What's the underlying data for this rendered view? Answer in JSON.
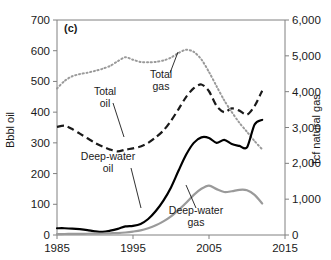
{
  "panel": {
    "label": "(c)"
  },
  "axes": {
    "left": {
      "title": "Bbbl oil",
      "ticks": [
        "0",
        "100",
        "200",
        "300",
        "400",
        "500",
        "600",
        "700"
      ],
      "min": 0,
      "max": 700,
      "step": 100
    },
    "right": {
      "title": "Tcf natural gas",
      "ticks": [
        "0",
        "1,000",
        "2,000",
        "3,000",
        "4,000",
        "5,000",
        "6,000"
      ],
      "min": 0,
      "max": 6000,
      "step": 1000
    },
    "bottom": {
      "title": "",
      "ticks": [
        "1985",
        "1995",
        "2005",
        "2015"
      ],
      "min": 1985,
      "max": 2015,
      "step": 10
    }
  },
  "annotations": [
    {
      "name": "total-gas",
      "lines": [
        "Total",
        "gas"
      ],
      "x": 161,
      "y": 78
    },
    {
      "name": "total-oil",
      "lines": [
        "Total",
        "oil"
      ],
      "x": 105,
      "y": 95
    },
    {
      "name": "deep-water-oil",
      "lines": [
        "Deep-water",
        "oil"
      ],
      "x": 108,
      "y": 160
    },
    {
      "name": "deep-water-gas",
      "lines": [
        "Deep-water",
        "gas"
      ],
      "x": 196,
      "y": 214
    }
  ],
  "colors": {
    "total_oil": "#1a1a1a",
    "total_gas": "#9a9a9a",
    "deep_water_oil": "#000000",
    "deep_water_gas": "#9a9a9a",
    "axis": "#808080",
    "text": "#1a1a1a"
  },
  "chart_data": {
    "type": "line",
    "title": "(c)",
    "xlabel": "",
    "ylabel": "Bbbl oil",
    "y2label": "Tcf natural gas",
    "xlim": [
      1985,
      2015
    ],
    "ylim": [
      0,
      700
    ],
    "y2lim": [
      0,
      6000
    ],
    "grid": false,
    "legend": "annotations-inline",
    "x": [
      1985,
      1986,
      1987,
      1988,
      1989,
      1990,
      1991,
      1992,
      1993,
      1994,
      1995,
      1996,
      1997,
      1998,
      1999,
      2000,
      2001,
      2002,
      2003,
      2004,
      2005,
      2006,
      2007,
      2008,
      2009,
      2010,
      2011,
      2012
    ],
    "series": [
      {
        "name": "Total oil",
        "axis": "left",
        "units": "Bbbl",
        "style": "dashed",
        "color": "#1a1a1a",
        "values": [
          352,
          356,
          345,
          330,
          315,
          300,
          288,
          278,
          272,
          278,
          282,
          288,
          300,
          318,
          340,
          372,
          410,
          450,
          478,
          490,
          468,
          420,
          400,
          412,
          405,
          392,
          420,
          470
        ]
      },
      {
        "name": "Total gas",
        "axis": "right",
        "units": "Tcf",
        "style": "dotted",
        "color": "#9a9a9a",
        "values": [
          4090,
          4300,
          4430,
          4490,
          4530,
          4580,
          4640,
          4720,
          4850,
          4960,
          4890,
          4830,
          4820,
          4830,
          4870,
          4950,
          5080,
          5170,
          5110,
          4900,
          4550,
          4150,
          3760,
          3430,
          3130,
          2880,
          2620,
          2390
        ]
      },
      {
        "name": "Deep-water oil",
        "axis": "left",
        "units": "Bbbl",
        "style": "solid",
        "color": "#000000",
        "values": [
          22,
          22,
          21,
          19,
          16,
          12,
          10,
          14,
          20,
          28,
          30,
          36,
          52,
          78,
          112,
          155,
          210,
          262,
          300,
          318,
          316,
          300,
          310,
          296,
          290,
          285,
          360,
          375
        ]
      },
      {
        "name": "Deep-water gas",
        "axis": "right",
        "units": "Tcf",
        "style": "solid",
        "color": "#9a9a9a",
        "values": [
          25,
          28,
          30,
          32,
          35,
          38,
          42,
          48,
          55,
          70,
          95,
          130,
          190,
          270,
          380,
          520,
          700,
          900,
          1120,
          1290,
          1380,
          1280,
          1200,
          1220,
          1260,
          1250,
          1120,
          880
        ]
      }
    ]
  }
}
